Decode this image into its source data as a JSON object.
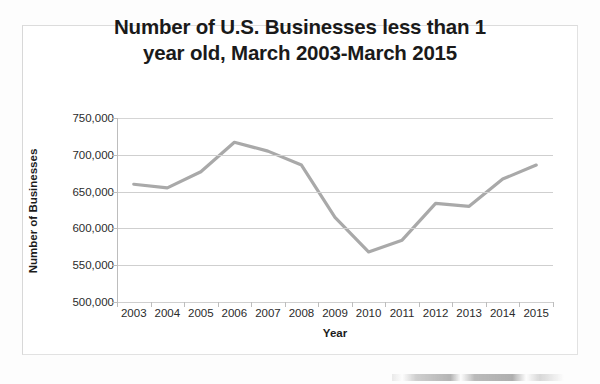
{
  "chart_data": {
    "type": "line",
    "title": "Number of U.S. Businesses less than 1 year old, March 2003-March 2015",
    "title_line1": "Number of U.S. Businesses less than 1",
    "title_line2": "year old, March 2003-March 2015",
    "xlabel": "Year",
    "ylabel": "Number of Businesses",
    "categories": [
      "2003",
      "2004",
      "2005",
      "2006",
      "2007",
      "2008",
      "2009",
      "2010",
      "2011",
      "2012",
      "2013",
      "2014",
      "2015"
    ],
    "values": [
      660000,
      655000,
      677000,
      717000,
      705000,
      686000,
      615000,
      568000,
      584000,
      634000,
      630000,
      667000,
      686000
    ],
    "ylim": [
      500000,
      750000
    ],
    "ytick_labels": [
      "750,000",
      "700,000",
      "650,000",
      "600,000",
      "550,000",
      "500,000"
    ],
    "ytick_values": [
      750000,
      700000,
      650000,
      600000,
      550000,
      500000
    ],
    "grid": true,
    "legend": "none",
    "series": [
      {
        "name": "Number of Businesses",
        "color": "#a9a9a9",
        "values": [
          660000,
          655000,
          677000,
          717000,
          705000,
          686000,
          615000,
          568000,
          584000,
          634000,
          630000,
          667000,
          686000
        ]
      }
    ]
  },
  "colors": {
    "line": "#a9a9a9",
    "gridline": "#cfcfcf",
    "axis": "#bdbdbd",
    "text": "#2b2b2b",
    "title": "#1a1a1a",
    "frame": "#e2e2e2",
    "background": "#ffffff"
  }
}
